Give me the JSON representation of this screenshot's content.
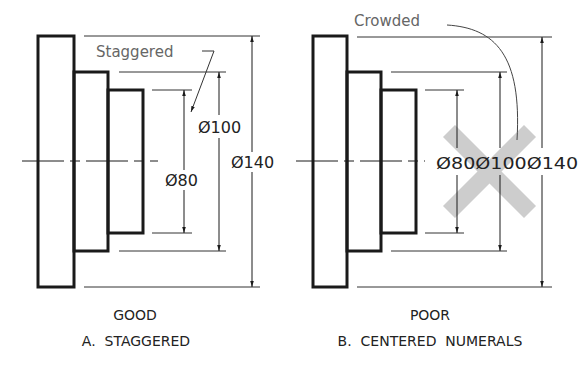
{
  "figures": [
    {
      "id": "A",
      "verdict": "GOOD",
      "caption": "A.  STAGGERED",
      "note": "Staggered",
      "dims": [
        "Ø80",
        "Ø100",
        "Ø140"
      ]
    },
    {
      "id": "B",
      "verdict": "POOR",
      "caption": "B.  CENTERED  NUMERALS",
      "note": "Crowded",
      "dims_combined": "Ø80Ø100Ø140"
    }
  ],
  "colors": {
    "ink": "#1a1a1a",
    "thin": "#333333",
    "note": "#666666",
    "cross": "#c8c8c8"
  }
}
